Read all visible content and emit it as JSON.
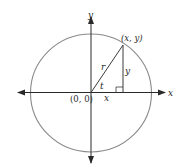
{
  "diagram": {
    "type": "unit-circle-trig",
    "colors": {
      "axis": "#2a2a2a",
      "circle": "#8a8a8a",
      "triangle": "#3a3a3a",
      "text": "#2a2a2a",
      "background": "#ffffff"
    },
    "axes": {
      "x_label": "x",
      "y_label": "y"
    },
    "origin_label": "(0, 0)",
    "point_label": "(x, y)",
    "radius_label": "r",
    "angle_label": "t",
    "horizontal_leg_label": "x",
    "vertical_leg_label": "y",
    "right_angle_marker": true
  }
}
